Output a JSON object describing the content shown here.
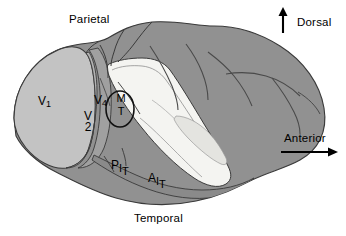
{
  "figure": {
    "background_color": "#ffffff"
  },
  "orientation": {
    "dorsal": {
      "label": "Dorsal",
      "icon": "arrow-up-icon",
      "direction": "up"
    },
    "anterior": {
      "label": "Anterior",
      "icon": "arrow-right-icon",
      "direction": "right"
    }
  },
  "lobes": {
    "parietal": "Parietal",
    "temporal": "Temporal"
  },
  "areas": {
    "v1": {
      "letter": "V",
      "subscript": "1"
    },
    "v2": {
      "letter": "V",
      "subscript": "2"
    },
    "v4": {
      "letter": "V",
      "subscript": "4"
    },
    "mt": {
      "top": "M",
      "bottom": "T"
    },
    "pit": {
      "c1": "P",
      "c2": "I",
      "c3": "T"
    },
    "ait": {
      "c1": "A",
      "c2": "I",
      "c3": "T"
    }
  },
  "colors": {
    "cortex_dark": "#919191",
    "cortex_mid": "#a8a8a8",
    "v1_light": "#c3c3c3",
    "sulcus_white": "#f4f4f1",
    "sulcus_pale": "#e4e4e0",
    "outline": "#3a3a3a",
    "text": "#000000"
  }
}
